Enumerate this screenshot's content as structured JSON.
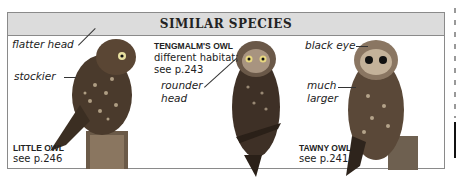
{
  "panel": {
    "title": "SIMILAR SPECIES"
  },
  "species": [
    {
      "name": "LITTLE OWL",
      "ref": "see p.246",
      "annotations": [
        "flatter head",
        "stockier"
      ]
    },
    {
      "name": "TENGMALM'S OWL",
      "note": "different habitat;",
      "ref": "see p.243",
      "annotations": [
        "rounder",
        "head"
      ]
    },
    {
      "name": "TAWNY OWL",
      "ref": "see p.241",
      "annotations": [
        "black eye",
        "much",
        "larger"
      ]
    }
  ],
  "colors": {
    "header_bg": "#dcdcdc",
    "border": "#8a8a8a",
    "text": "#222222"
  }
}
